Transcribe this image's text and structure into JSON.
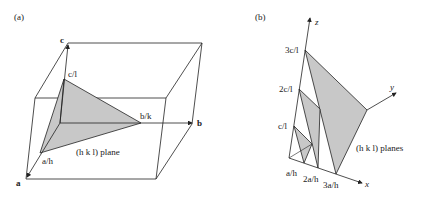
{
  "panel_a": {
    "tag": "(a)",
    "axis_labels": {
      "a": "a",
      "b": "b",
      "c": "c"
    },
    "intercepts": {
      "a": "a/h",
      "b": "b/k",
      "c": "c/l"
    },
    "plane_label": "(h k l) plane"
  },
  "panel_b": {
    "tag": "(b)",
    "axis_labels": {
      "x": "x",
      "y": "y",
      "z": "z"
    },
    "z_intercepts": [
      "c/l",
      "2c/l",
      "3c/l"
    ],
    "x_intercepts": [
      "a/h",
      "2a/h",
      "3a/h"
    ],
    "plane_label": "(h k l) planes"
  },
  "colors": {
    "line": "#222222",
    "plane_fill": "#c8c8c8"
  }
}
